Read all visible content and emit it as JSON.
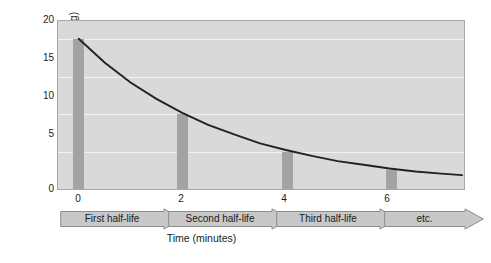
{
  "chart_data": {
    "type": "line",
    "title": "",
    "subtitle": "",
    "xlabel": "Time (minutes)",
    "ylabel_text": "Mass",
    "ylabel_isotope_superscript": "15",
    "ylabel_isotope_subscript": "8",
    "ylabel_isotope_symbol": "O",
    "ylabel_units": "(mg)",
    "ylabel_full": "Mass 15-8 O (mg)",
    "xlim": [
      -0.4,
      7.4
    ],
    "ylim": [
      0,
      22.4
    ],
    "yticks": [
      0,
      5,
      10,
      15,
      20
    ],
    "ytick_labels": [
      "0",
      "5",
      "10",
      "15",
      "20"
    ],
    "xticks": [
      0,
      2,
      4,
      6
    ],
    "xtick_labels": [
      "0",
      "2",
      "4",
      "6"
    ],
    "grid": true,
    "grid_axis": "y",
    "legend": false,
    "series": [
      {
        "name": "Mass of oxygen-15 remaining",
        "type": "line",
        "x": [
          0,
          0.5,
          1,
          1.5,
          2,
          2.5,
          3,
          3.5,
          4,
          4.5,
          5,
          5.5,
          6,
          6.5,
          7,
          7.4
        ],
        "values": [
          20.0,
          16.8,
          14.1,
          11.9,
          10.0,
          8.4,
          7.1,
          5.9,
          5.0,
          4.2,
          3.5,
          3.0,
          2.5,
          2.1,
          1.8,
          1.6
        ]
      },
      {
        "name": "Mass at half-life intervals",
        "type": "bar",
        "categories": [
          "0",
          "2",
          "4",
          "6"
        ],
        "values": [
          20.0,
          10.0,
          5.0,
          2.5
        ]
      }
    ],
    "annotations": [
      {
        "label": "First half-life",
        "x_start": 0,
        "x_end": 2
      },
      {
        "label": "Second half-life",
        "x_start": 2,
        "x_end": 4
      },
      {
        "label": "Third half-life",
        "x_start": 4,
        "x_end": 6
      },
      {
        "label": "etc.",
        "x_start": 6,
        "x_end": 7.4
      }
    ],
    "colors": {
      "plot_background": "#d9d9d9",
      "gridline": "#f2f2f2",
      "bar": "#a3a3a3",
      "curve": "#222222",
      "arrow_fill": "#c8c8c8",
      "arrow_stroke": "#8d8d8d",
      "plot_border": "#a8a8a8",
      "text": "#1b1b1b"
    }
  }
}
